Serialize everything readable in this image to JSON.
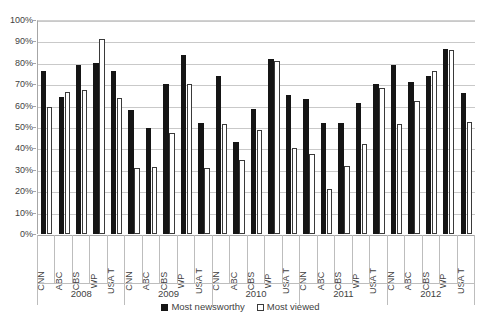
{
  "chart_data": {
    "type": "bar",
    "title": "",
    "xlabel": "",
    "ylabel": "",
    "ylim": [
      0,
      100
    ],
    "y_tick_labels": [
      "0%",
      "10%",
      "20%",
      "30%",
      "40%",
      "50%",
      "60%",
      "70%",
      "80%",
      "90%",
      "100%"
    ],
    "y_tick_values": [
      0,
      10,
      20,
      30,
      40,
      50,
      60,
      70,
      80,
      90,
      100
    ],
    "grid": true,
    "legend_position": "bottom-center",
    "group_labels": [
      "2008",
      "2009",
      "2010",
      "2011",
      "2012"
    ],
    "categories": [
      "CNN",
      "ABC",
      "CBS",
      "WP",
      "USA T",
      "CNN",
      "ABC",
      "CBS",
      "WP",
      "USA T",
      "CNN",
      "ABC",
      "CBS",
      "WP",
      "USA T",
      "CNN",
      "ABC",
      "CBS",
      "WP",
      "USA T",
      "CNN",
      "ABC",
      "CBS",
      "WP",
      "USA T"
    ],
    "series": [
      {
        "name": "Most newsworthy",
        "color": "#151515",
        "values": [
          76,
          64,
          79,
          80,
          76,
          58,
          49.5,
          70,
          83.5,
          52,
          74,
          43,
          58.5,
          82,
          65,
          63,
          52,
          52,
          61,
          70,
          79,
          71,
          74,
          86.5,
          66
        ]
      },
      {
        "name": "Most viewed",
        "color": "#ffffff",
        "values": [
          59.5,
          66.5,
          67.5,
          91,
          63.5,
          31,
          31.5,
          47,
          70,
          31,
          51.5,
          34.5,
          48.5,
          81,
          40,
          37.5,
          21,
          32,
          42,
          68,
          51.5,
          62,
          76,
          86,
          52.5
        ]
      }
    ]
  },
  "legend": {
    "items": [
      {
        "label": "Most newsworthy",
        "style": "newsworthy"
      },
      {
        "label": "Most viewed",
        "style": "viewed"
      }
    ]
  }
}
